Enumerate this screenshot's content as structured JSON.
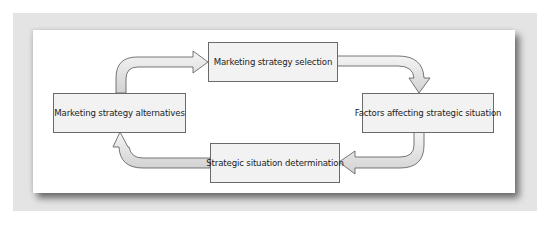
{
  "diagram": {
    "type": "cycle",
    "nodes": [
      {
        "id": "selection",
        "label": "Marketing strategy selection"
      },
      {
        "id": "factors",
        "label": "Factors affecting strategic situation"
      },
      {
        "id": "determination",
        "label": "Strategic situation determination"
      },
      {
        "id": "alternatives",
        "label": "Marketing strategy alternatives"
      }
    ],
    "edges": [
      {
        "from": "alternatives",
        "to": "selection"
      },
      {
        "from": "selection",
        "to": "factors"
      },
      {
        "from": "factors",
        "to": "determination"
      },
      {
        "from": "determination",
        "to": "alternatives"
      }
    ]
  },
  "colors": {
    "frame": "#e4e4e4",
    "panel": "#ffffff",
    "box_fill": "#f2f2f2",
    "box_border": "#6a6a6a",
    "arrow_fill": "#e0e0e0",
    "arrow_stroke": "#555555"
  }
}
